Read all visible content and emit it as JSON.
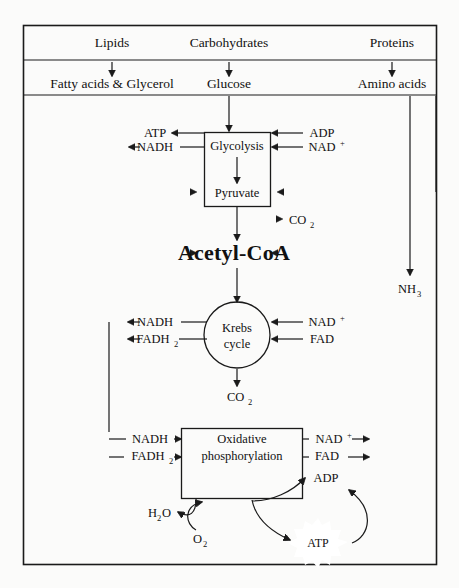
{
  "diagram": {
    "type": "metabolic-pathway-flowchart",
    "border_color": "#1a1a1a",
    "background_color": "#fbfbfa",
    "text_color": "#111111"
  },
  "row_inputs": {
    "lipids": "Lipids",
    "carbohydrates": "Carbohydrates",
    "proteins": "Proteins"
  },
  "row_monomers": {
    "fatty_acids": "Fatty acids & Glycerol",
    "glucose": "Glucose",
    "amino_acids": "Amino acids"
  },
  "glycolysis": {
    "box_label": "Glycolysis",
    "pyruvate_label": "Pyruvate",
    "out_atp": "ATP",
    "out_nadh": "NADH",
    "in_adp": "ADP",
    "in_nad": "NAD",
    "in_nad_sup": "+",
    "co2": "CO",
    "co2_sub": "2"
  },
  "acetyl": {
    "label": "Acetyl-CoA"
  },
  "ammonia": {
    "label": "NH",
    "sub": "3"
  },
  "krebs": {
    "line1": "Krebs",
    "line2": "cycle",
    "out_nadh": "NADH",
    "out_fadh2": "FADH",
    "out_fadh2_sub": "2",
    "in_nad": "NAD",
    "in_nad_sup": "+",
    "in_fad": "FAD",
    "co2": "CO",
    "co2_sub": "2"
  },
  "oxphos": {
    "line1": "Oxidative",
    "line2": "phosphorylation",
    "in_nadh": "NADH",
    "in_fadh2": "FADH",
    "in_fadh2_sub": "2",
    "out_nad": "NAD",
    "out_nad_sup": "+",
    "out_fad": "FAD",
    "adp": "ADP",
    "water": "H",
    "water_sub": "2",
    "water_o": "O",
    "oxygen": "O",
    "oxygen_sub": "2",
    "atp": "ATP"
  }
}
